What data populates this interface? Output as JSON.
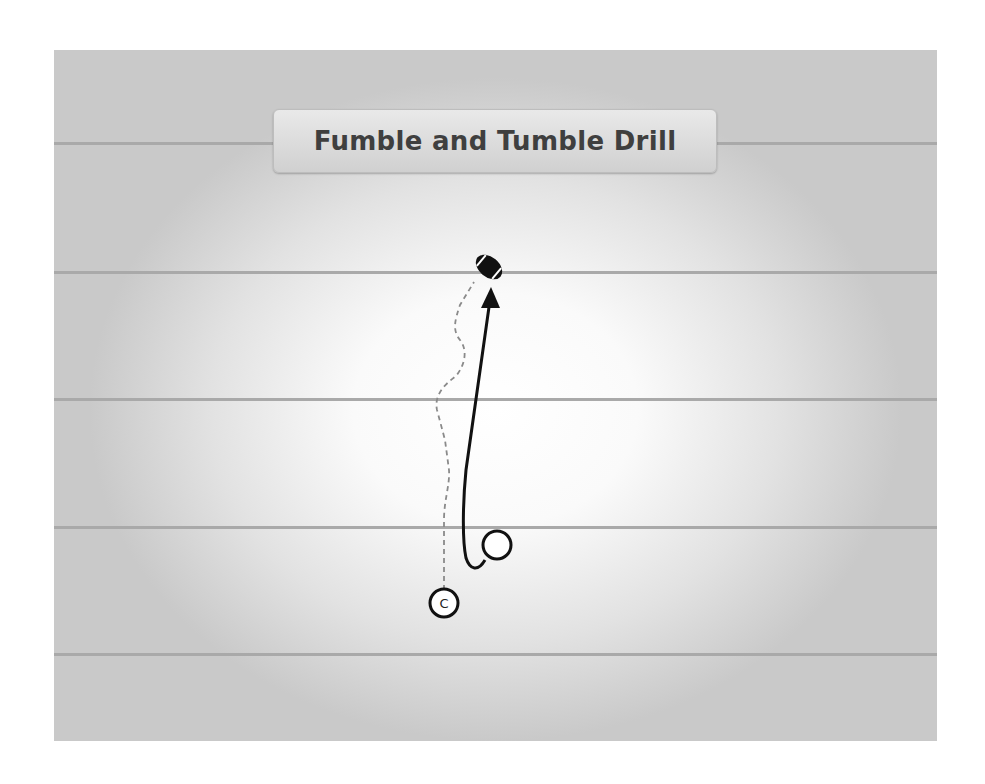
{
  "diagram": {
    "title": "Fumble and Tumble Drill",
    "type": "football drill play diagram",
    "yard_lines_y": [
      143,
      273,
      400,
      528,
      655
    ],
    "players": [
      {
        "id": "coach",
        "label": "C",
        "x": 444,
        "y": 603,
        "style": "labeled-circle"
      },
      {
        "id": "player",
        "label": "",
        "x": 497,
        "y": 545,
        "style": "open-circle"
      }
    ],
    "objects": [
      {
        "id": "football",
        "type": "ball",
        "x": 489,
        "y": 267
      }
    ],
    "routes": [
      {
        "from": "coach",
        "to": "football",
        "style": "dashed",
        "meaning": "ball toss"
      },
      {
        "from": "player",
        "to": "football",
        "style": "solid-arrow",
        "meaning": "player run"
      }
    ]
  }
}
